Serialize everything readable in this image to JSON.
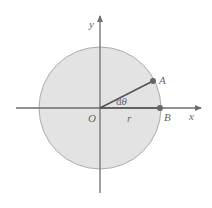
{
  "diagram": {
    "type": "circle-polar-angle",
    "colors": {
      "background": "#ffffff",
      "circle_fill": "#e3e3e3",
      "circle_stroke": "#9a9a9a",
      "axis": "#6e6e6e",
      "radius_line": "#555555",
      "point": "#666666",
      "label": "#666666"
    },
    "labels": {
      "y_axis": "y",
      "x_axis": "x",
      "origin": "O",
      "radius": "r",
      "point_a": "A",
      "point_b": "B",
      "angle_d": "d",
      "angle_theta": "θ"
    },
    "geometry": {
      "origin": [
        100,
        108
      ],
      "radius_px": 61,
      "point_a": [
        153,
        81
      ],
      "point_b": [
        160,
        108
      ]
    }
  }
}
